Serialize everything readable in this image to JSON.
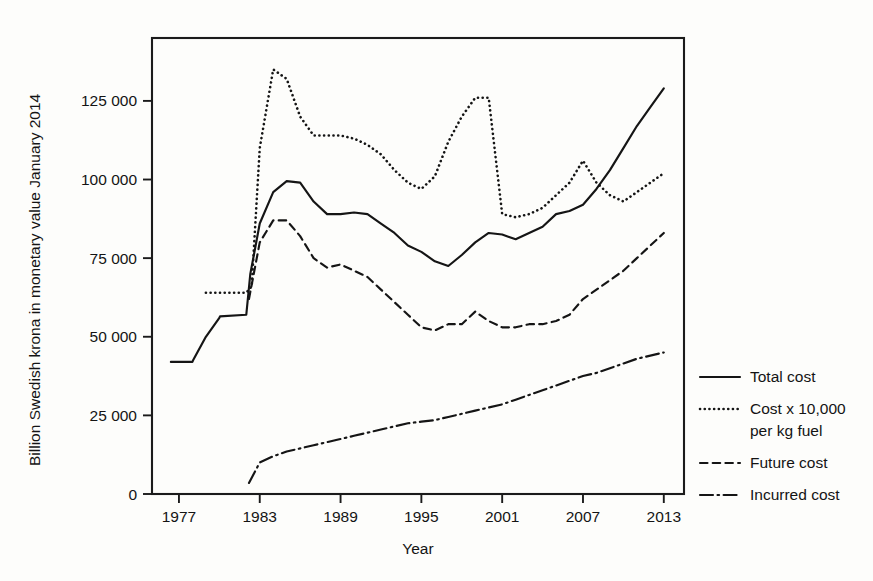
{
  "chart_data": {
    "type": "line",
    "title": "",
    "xlabel": "Year",
    "ylabel": "Billion Swedish krona in monetary value January 2014",
    "xlim": [
      1975,
      2014.5
    ],
    "ylim": [
      0,
      145000
    ],
    "xticks": [
      1977,
      1983,
      1989,
      1995,
      2001,
      2007,
      2013
    ],
    "xtick_labels": [
      "1977",
      "1983",
      "1989",
      "1995",
      "2001",
      "2007",
      "2013"
    ],
    "yticks": [
      0,
      25000,
      50000,
      75000,
      100000,
      125000
    ],
    "ytick_labels": [
      "0",
      "25 000",
      "50 000",
      "75 000",
      "100 000",
      "125 000"
    ],
    "grid": false,
    "legend_position": "right",
    "series": [
      {
        "name": "Total cost",
        "style": "solid",
        "x": [
          1976.4,
          1978.0,
          1978.05,
          1979.0,
          1980.0,
          1980.05,
          1982.0,
          1982.3,
          1983.0,
          1984.0,
          1985.0,
          1986.0,
          1987.0,
          1988.0,
          1989.0,
          1990.0,
          1991.0,
          1992.0,
          1993.0,
          1994.0,
          1995.0,
          1996.0,
          1997.0,
          1998.0,
          1999.0,
          2000.0,
          2001.0,
          2002.0,
          2003.0,
          2004.0,
          2005.0,
          2006.0,
          2007.0,
          2008.0,
          2009.0,
          2010.0,
          2011.0,
          2012.0,
          2013.0
        ],
        "y": [
          42000,
          42000,
          42500,
          50000,
          56000,
          56500,
          57000,
          70000,
          86000,
          96000,
          99500,
          99000,
          93000,
          89000,
          89000,
          89500,
          89000,
          86000,
          83000,
          79000,
          77000,
          74000,
          72500,
          76000,
          80000,
          83000,
          82500,
          81000,
          83000,
          85000,
          89000,
          90000,
          92000,
          97000,
          103000,
          110000,
          117000,
          123000,
          129000
        ]
      },
      {
        "name": "Cost x 10,000 per kg fuel",
        "style": "dotted",
        "x": [
          1979.0,
          1982.0,
          1982.4,
          1983.0,
          1984.0,
          1985.0,
          1986.0,
          1987.0,
          1988.0,
          1989.0,
          1990.0,
          1991.0,
          1992.0,
          1993.0,
          1994.0,
          1995.0,
          1996.0,
          1997.0,
          1998.0,
          1999.0,
          2000.0,
          2001.0,
          2002.0,
          2003.0,
          2004.0,
          2005.0,
          2006.0,
          2007.0,
          2008.0,
          2009.0,
          2010.0,
          2011.0,
          2012.0,
          2013.0
        ],
        "y": [
          64000,
          64000,
          66000,
          110000,
          135000,
          132000,
          120000,
          114000,
          114000,
          114000,
          113000,
          111000,
          108000,
          103000,
          99000,
          97000,
          101000,
          112000,
          120000,
          126000,
          126000,
          89000,
          88000,
          89000,
          91000,
          95000,
          99000,
          106000,
          99000,
          95000,
          93000,
          96000,
          99000,
          102000
        ]
      },
      {
        "name": "Future cost",
        "style": "dashed",
        "x": [
          1982.2,
          1983.0,
          1984.0,
          1985.0,
          1986.0,
          1987.0,
          1988.0,
          1989.0,
          1990.0,
          1991.0,
          1992.0,
          1993.0,
          1994.0,
          1995.0,
          1996.0,
          1997.0,
          1998.0,
          1999.0,
          2000.0,
          2001.0,
          2002.0,
          2003.0,
          2004.0,
          2005.0,
          2006.0,
          2007.0,
          2008.0,
          2009.0,
          2010.0,
          2011.0,
          2012.0,
          2013.0
        ],
        "y": [
          62000,
          80000,
          87000,
          87000,
          82000,
          75000,
          72000,
          73000,
          71000,
          69000,
          65000,
          61000,
          57000,
          53000,
          52000,
          54000,
          54000,
          58000,
          55000,
          53000,
          53000,
          54000,
          54000,
          55000,
          57000,
          62000,
          65000,
          68000,
          71000,
          75000,
          79000,
          83000
        ]
      },
      {
        "name": "Incurred cost",
        "style": "dashdot",
        "x": [
          1982.2,
          1983.0,
          1984.0,
          1985.0,
          1986.0,
          1987.0,
          1988.0,
          1989.0,
          1990.0,
          1991.0,
          1992.0,
          1993.0,
          1994.0,
          1995.0,
          1996.0,
          1997.0,
          1998.0,
          1999.0,
          2000.0,
          2001.0,
          2002.0,
          2003.0,
          2004.0,
          2005.0,
          2006.0,
          2007.0,
          2008.0,
          2009.0,
          2010.0,
          2011.0,
          2012.0,
          2013.0
        ],
        "y": [
          3500,
          10000,
          12000,
          13500,
          14500,
          15500,
          16500,
          17500,
          18500,
          19500,
          20500,
          21500,
          22500,
          23000,
          23500,
          24500,
          25500,
          26500,
          27500,
          28500,
          30000,
          31500,
          33000,
          34500,
          36000,
          37500,
          38500,
          40000,
          41500,
          43000,
          44000,
          45000
        ]
      }
    ]
  },
  "legend": {
    "entries": [
      {
        "label": "Total cost",
        "style": "solid"
      },
      {
        "label": "Cost x 10,000",
        "label2": "per kg fuel",
        "style": "dotted"
      },
      {
        "label": "Future cost",
        "style": "dashed"
      },
      {
        "label": "Incurred cost",
        "style": "dashdot"
      }
    ]
  },
  "colors": {
    "ink": "#151515",
    "background": "#fdfdfb"
  }
}
